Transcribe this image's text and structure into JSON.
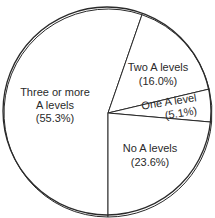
{
  "chart_data": {
    "type": "pie",
    "title": "",
    "categories": [
      "Three or more A levels",
      "Two A levels",
      "One A level",
      "No A levels"
    ],
    "values": [
      55.3,
      16.0,
      5.1,
      23.6
    ],
    "unit": "%",
    "labels": [
      {
        "lines": [
          "Three or more",
          "A levels",
          "(55.3%)"
        ]
      },
      {
        "lines": [
          "Two A levels",
          "(16.0%)"
        ]
      },
      {
        "lines": [
          "One A level",
          "(5.1%)"
        ]
      },
      {
        "lines": [
          "No A levels",
          "(23.6%)"
        ]
      }
    ],
    "legend": "none",
    "colors": {
      "fill": "#ffffff",
      "stroke": "#2a2a2a",
      "text": "#2a2a2a"
    }
  }
}
